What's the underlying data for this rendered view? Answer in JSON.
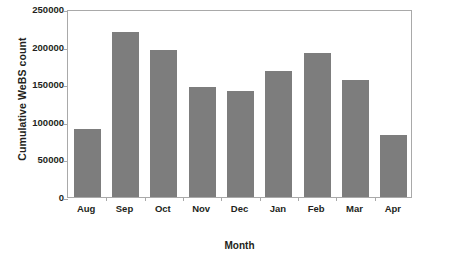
{
  "chart_data": {
    "type": "bar",
    "title": "",
    "xlabel": "Month",
    "ylabel": "Cumulative WeBS count",
    "categories": [
      "Aug",
      "Sep",
      "Oct",
      "Nov",
      "Dec",
      "Jan",
      "Feb",
      "Mar",
      "Apr"
    ],
    "values": [
      90000,
      220000,
      195000,
      146000,
      141000,
      167000,
      192000,
      155000,
      82000
    ],
    "ylim": [
      0,
      250000
    ],
    "yticks": [
      0,
      50000,
      100000,
      150000,
      200000,
      250000
    ],
    "ytick_labels": [
      "0",
      "50000",
      "100000",
      "150000",
      "200000",
      "250000"
    ],
    "grid": false,
    "legend": false,
    "bar_color": "#7d7d7d",
    "frame_color": "#a9a9a9",
    "text_color": "#231f20"
  }
}
